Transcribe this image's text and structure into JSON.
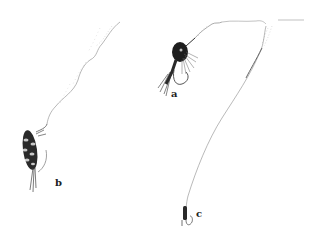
{
  "figure": {
    "background": "#ffffff",
    "ink_color": "#1a1a1a",
    "line_color": "#8a8a8a",
    "items": [
      {
        "label": "a",
        "subject": "hackle fly on hook with leader line"
      },
      {
        "label": "b",
        "subject": "segmented nymph/larva fly on line"
      },
      {
        "label": "c",
        "subject": "small fly on long curved line"
      }
    ]
  }
}
